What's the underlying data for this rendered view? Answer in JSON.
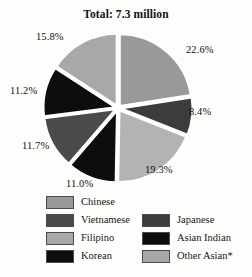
{
  "chart_data": {
    "type": "pie",
    "title": "Total: 7.3 million",
    "xlabel": "",
    "ylabel": "",
    "legend_position": "bottom",
    "grid": false,
    "total_label": "Total: 7.3 million",
    "total_value": 7.3,
    "total_units": "million",
    "categories": [
      "Chinese",
      "Japanese",
      "Other Asian*",
      "Korean",
      "Vietnamese",
      "Asian Indian",
      "Filipino"
    ],
    "values": [
      22.6,
      8.4,
      19.3,
      11.0,
      11.7,
      11.2,
      15.8
    ],
    "value_labels": [
      "22.6%",
      "8.4%",
      "19.3%",
      "11.0%",
      "11.7%",
      "11.2%",
      "15.8%"
    ],
    "colors": [
      "#999999",
      "#3c3c3c",
      "#b3b3b3",
      "#0d0d0d",
      "#4b4b4b",
      "#0d0d0d",
      "#a8a8a8"
    ],
    "slices": [
      {
        "label": "Chinese",
        "value": 22.6,
        "value_label": "22.6%",
        "color": "#999999",
        "start_deg": 0.0,
        "end_deg": 81.36
      },
      {
        "label": "Japanese",
        "value": 8.4,
        "value_label": "8.4%",
        "color": "#3c3c3c",
        "start_deg": 81.36,
        "end_deg": 111.6
      },
      {
        "label": "Other Asian*",
        "value": 19.3,
        "value_label": "19.3%",
        "color": "#b3b3b3",
        "start_deg": 111.6,
        "end_deg": 181.08
      },
      {
        "label": "Korean",
        "value": 11.0,
        "value_label": "11.0%",
        "color": "#0d0d0d",
        "start_deg": 181.08,
        "end_deg": 220.68
      },
      {
        "label": "Vietnamese",
        "value": 11.7,
        "value_label": "11.7%",
        "color": "#4b4b4b",
        "start_deg": 220.68,
        "end_deg": 262.8
      },
      {
        "label": "Asian Indian",
        "value": 11.2,
        "value_label": "11.2%",
        "color": "#0d0d0d",
        "start_deg": 262.8,
        "end_deg": 303.12
      },
      {
        "label": "Filipino",
        "value": 15.8,
        "value_label": "15.8%",
        "color": "#a8a8a8",
        "start_deg": 303.12,
        "end_deg": 360.0
      }
    ]
  },
  "title": {
    "text": "Total: 7.3 million"
  },
  "callouts": {
    "chinese": "22.6%",
    "japanese": "8.4%",
    "other_asian": "19.3%",
    "korean": "11.0%",
    "vietnamese": "11.7%",
    "asian_indian": "11.2%",
    "filipino": "15.8%"
  },
  "legend": {
    "rows": [
      {
        "left": {
          "label": "Chinese",
          "color": "#999999"
        },
        "right": {
          "label": "",
          "color": ""
        }
      },
      {
        "left": {
          "label": "Vietnamese",
          "color": "#4b4b4b"
        },
        "right": {
          "label": "Japanese",
          "color": "#3c3c3c"
        }
      },
      {
        "left": {
          "label": "Filipino",
          "color": "#a8a8a8"
        },
        "right": {
          "label": "Asian Indian",
          "color": "#0d0d0d"
        }
      },
      {
        "left": {
          "label": "Korean",
          "color": "#0d0d0d"
        },
        "right": {
          "label": "Other Asian*",
          "color": "#a8a8a8"
        }
      }
    ]
  },
  "caption": {
    "sliver_text": " "
  }
}
